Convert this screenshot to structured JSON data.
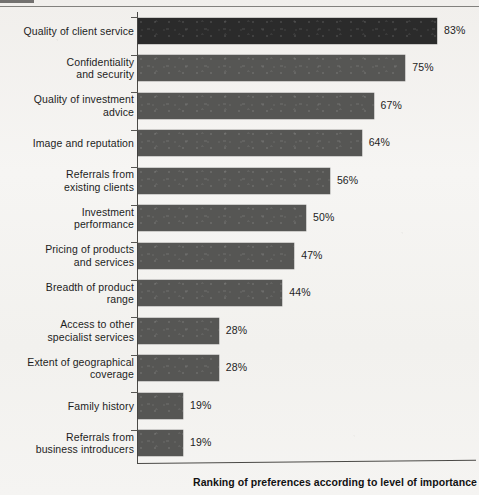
{
  "chart_data": {
    "type": "bar",
    "orientation": "horizontal",
    "title": "",
    "xlabel": "Ranking of preferences according to level of importance",
    "ylabel": "",
    "xlim": [
      0,
      90
    ],
    "grid": false,
    "legend": null,
    "value_suffix": "%",
    "categories": [
      "Quality of client service",
      "Confidentiality\nand security",
      "Quality of investment\nadvice",
      "Image and reputation",
      "Referrals from\nexisting clients",
      "Investment\nperformance",
      "Pricing of products\nand services",
      "Breadth of product\nrange",
      "Access to other\nspecialist services",
      "Extent of geographical\ncoverage",
      "Family history",
      "Referrals from\nbusiness introducers"
    ],
    "values": [
      83,
      75,
      67,
      64,
      56,
      50,
      47,
      44,
      28,
      28,
      19,
      19
    ],
    "value_labels": [
      "83%",
      "75%",
      "67%",
      "64%",
      "56%",
      "50%",
      "47%",
      "44%",
      "28%",
      "28%",
      "19%",
      "19%"
    ],
    "bar_colors": [
      "#2b2b2b",
      "#565654",
      "#565654",
      "#565654",
      "#565654",
      "#565654",
      "#565654",
      "#565654",
      "#565654",
      "#565654",
      "#565654",
      "#565654"
    ],
    "highlighted_index": 0
  },
  "colors": {
    "page_background": "#f4f3f1",
    "bar_default": "#565654",
    "bar_highlight": "#2b2b2b",
    "axis": "#4a4946",
    "text": "#1d1d1d"
  }
}
